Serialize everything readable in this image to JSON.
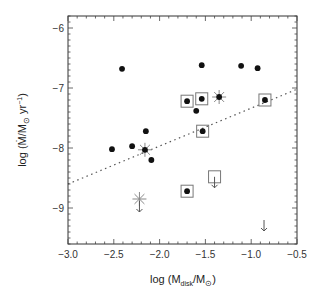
{
  "chart_data": {
    "type": "scatter",
    "title": "",
    "xlabel": "log (M_disk/M_⊙)",
    "ylabel": "log (Ṁ/M_⊙ yr⁻¹)",
    "xlim": [
      -3.0,
      -0.5
    ],
    "ylim": [
      -9.6,
      -5.8
    ],
    "xticks": [
      -3.0,
      -2.5,
      -2.0,
      -1.5,
      -1.0,
      -0.5
    ],
    "xtick_labels": [
      "−3.0",
      "−2.5",
      "−2.0",
      "−1.5",
      "−1.0",
      "−0.5"
    ],
    "yticks": [
      -6,
      -7,
      -8,
      -9
    ],
    "ytick_labels": [
      "−6",
      "−7",
      "−8",
      "−9"
    ],
    "grid": false,
    "legend": null,
    "series": [
      {
        "name": "filled circles",
        "marker": "filled-circle",
        "points": [
          [
            -2.52,
            -8.02
          ],
          [
            -2.3,
            -7.97
          ],
          [
            -2.15,
            -7.72
          ],
          [
            -2.09,
            -8.2
          ],
          [
            -2.41,
            -6.68
          ],
          [
            -1.54,
            -6.62
          ],
          [
            -1.11,
            -6.63
          ],
          [
            -0.93,
            -6.67
          ],
          [
            -1.6,
            -7.38
          ]
        ]
      },
      {
        "name": "boxed filled circles",
        "marker": "boxed-circle",
        "points": [
          [
            -1.7,
            -7.22
          ],
          [
            -1.54,
            -7.18
          ],
          [
            -0.85,
            -7.2
          ],
          [
            -1.53,
            -7.72
          ],
          [
            -1.7,
            -8.72
          ]
        ]
      },
      {
        "name": "starred circles",
        "marker": "star-circle",
        "points": [
          [
            -2.16,
            -8.03
          ],
          [
            -1.35,
            -7.15
          ]
        ]
      },
      {
        "name": "star upper limit",
        "marker": "star-arrow",
        "points": [
          [
            -2.22,
            -8.85
          ]
        ]
      },
      {
        "name": "open box upper limit",
        "marker": "box-arrow",
        "points": [
          [
            -1.4,
            -8.48
          ]
        ]
      },
      {
        "name": "upper limit",
        "marker": "arrow",
        "points": [
          [
            -0.86,
            -9.3
          ]
        ]
      }
    ],
    "fit_line": {
      "style": "dotted",
      "x": [
        -3.0,
        -0.5
      ],
      "y": [
        -8.6,
        -7.02
      ]
    }
  }
}
